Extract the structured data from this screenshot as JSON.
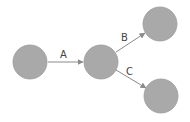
{
  "diagram": {
    "type": "directed-graph",
    "colors": {
      "node_fill": "#a9a9a9",
      "node_stroke": "#9a9a9a",
      "edge": "#8a8a8a",
      "label": "#444444",
      "background": "#ffffff"
    },
    "nodes": [
      {
        "id": "n1",
        "label": "",
        "cx": 30,
        "cy": 62,
        "r": 17
      },
      {
        "id": "n2",
        "label": "",
        "cx": 101,
        "cy": 62,
        "r": 17
      },
      {
        "id": "n3",
        "label": "",
        "cx": 160,
        "cy": 24,
        "r": 17
      },
      {
        "id": "n4",
        "label": "",
        "cx": 161,
        "cy": 96,
        "r": 17
      }
    ],
    "edges": [
      {
        "id": "A",
        "from": "n1",
        "to": "n2",
        "label": "A"
      },
      {
        "id": "B",
        "from": "n2",
        "to": "n3",
        "label": "B"
      },
      {
        "id": "C",
        "from": "n2",
        "to": "n4",
        "label": "C"
      }
    ]
  }
}
